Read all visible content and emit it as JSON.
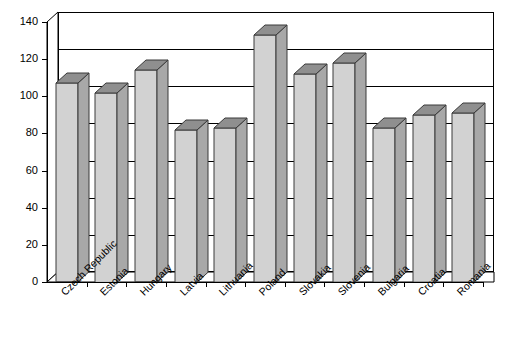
{
  "chart_data": {
    "type": "bar",
    "title": "",
    "subtitle": "",
    "xlabel": "",
    "ylabel": "",
    "categories": [
      "Czech Republic",
      "Estonia",
      "Hungary",
      "Latvia",
      "Lithuania",
      "Poland",
      "Slovakia",
      "Slovenia",
      "Bulgaria",
      "Croatia",
      "Romania"
    ],
    "values": [
      107,
      102,
      114,
      82,
      83,
      133,
      112,
      118,
      83,
      90,
      91
    ],
    "ylim": [
      0,
      140
    ],
    "ytick_labels": [
      "0",
      "20",
      "40",
      "60",
      "80",
      "100",
      "120",
      "140"
    ],
    "ytick_values": [
      0,
      20,
      40,
      60,
      80,
      100,
      120,
      140
    ],
    "grid": true,
    "legend": "none",
    "style": "3d-column",
    "bar_face_color": "#d2d2d2",
    "bar_side_color": "#a8a8a8",
    "bar_top_color": "#8f8f8f",
    "bar_edge_color": "#3a3a3a",
    "axis_color": "#000000",
    "background_color": "#ffffff"
  }
}
